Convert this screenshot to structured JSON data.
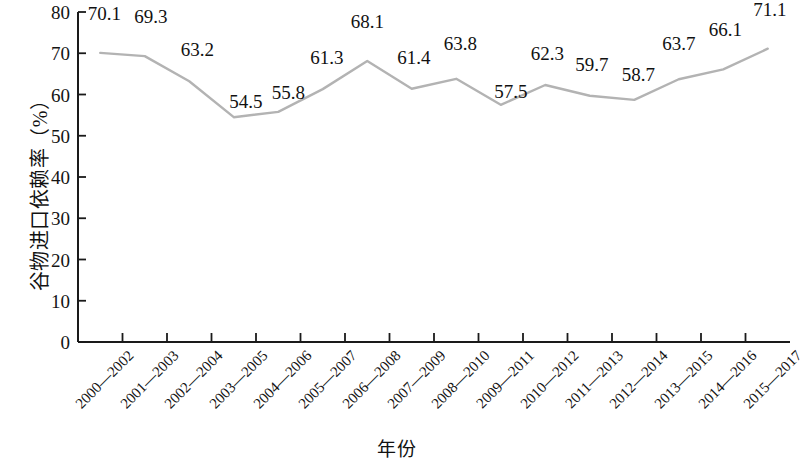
{
  "chart_data": {
    "type": "line",
    "title": "",
    "xlabel": "年份",
    "ylabel": "谷物进口依赖率（%）",
    "ylim": [
      0,
      80
    ],
    "yticks": [
      0,
      10,
      20,
      30,
      40,
      50,
      60,
      70,
      80
    ],
    "grid": false,
    "legend": "none",
    "line_color": "#b3b3b3",
    "axis_color": "#1a1a1a",
    "categories": [
      "2000—2002",
      "2001—2003",
      "2002—2004",
      "2003—2005",
      "2004—2006",
      "2005—2007",
      "2006—2008",
      "2007—2009",
      "2008—2010",
      "2009—2011",
      "2010—2012",
      "2011—2013",
      "2012—2014",
      "2013—2015",
      "2014—2016",
      "2015—2017"
    ],
    "values": [
      70.1,
      69.3,
      63.2,
      54.5,
      55.8,
      61.3,
      68.1,
      61.4,
      63.8,
      57.5,
      62.3,
      59.7,
      58.7,
      63.7,
      66.1,
      71.1
    ],
    "value_labels": [
      "70.1",
      "69.3",
      "63.2",
      "54.5",
      "55.8",
      "61.3",
      "68.1",
      "61.4",
      "63.8",
      "57.5",
      "62.3",
      "59.7",
      "58.7",
      "63.7",
      "66.1",
      "71.1"
    ],
    "ytick_labels": [
      "0",
      "10",
      "20",
      "30",
      "40",
      "50",
      "60",
      "70",
      "80"
    ]
  }
}
